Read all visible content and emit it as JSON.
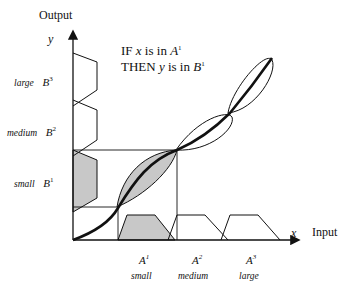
{
  "axes": {
    "y_title": "Output",
    "y_var": "y",
    "x_title": "Input",
    "x_var": "x"
  },
  "rule": {
    "line1_prefix": "IF",
    "line1_var": "x",
    "line1_mid": "is  in",
    "line1_set": "A",
    "line1_sup": "1",
    "line2_prefix": "THEN",
    "line2_var": "y",
    "line2_mid": "is  in",
    "line2_set": "B",
    "line2_sup": "1"
  },
  "output_sets": [
    {
      "ling": "large",
      "set": "B",
      "sup": "3"
    },
    {
      "ling": "medium",
      "set": "B",
      "sup": "2"
    },
    {
      "ling": "small",
      "set": "B",
      "sup": "1"
    }
  ],
  "input_sets": [
    {
      "set": "A",
      "sup": "1",
      "ling": "small"
    },
    {
      "set": "A",
      "sup": "2",
      "ling": "medium"
    },
    {
      "set": "A",
      "sup": "3",
      "ling": "large"
    }
  ],
  "colors": {
    "stroke": "#111111",
    "fill_shaded": "#c8c8c8"
  }
}
